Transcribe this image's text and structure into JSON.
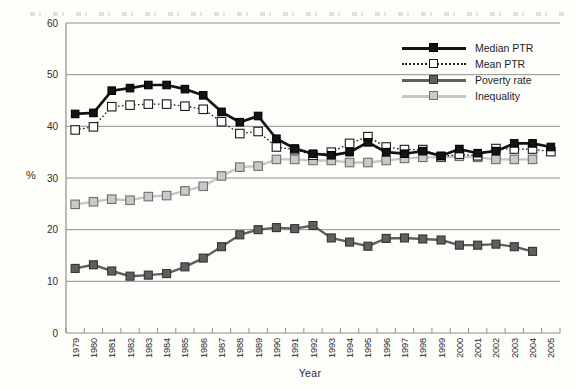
{
  "axis": {
    "y_unit_label": "%",
    "x_axis_label": "Year"
  },
  "style": {
    "background": "#fdfdfa",
    "grid_color": "#8f8f8f",
    "axis_color": "#8f8f8f",
    "tick_text_color": "#2e2e2e"
  },
  "chart_data": {
    "type": "line",
    "title": "",
    "xlabel": "Year",
    "ylabel": "%",
    "ylim": [
      0,
      60
    ],
    "yticks": [
      0,
      10,
      20,
      30,
      40,
      50,
      60
    ],
    "grid": "horizontal",
    "legend_position": "top-right",
    "x_tick_rotation": -90,
    "marker": "square",
    "categories": [
      "1979",
      "1980",
      "1981",
      "1982",
      "1983",
      "1984",
      "1985",
      "1986",
      "1987",
      "1988",
      "1989",
      "1990",
      "1991",
      "1992",
      "1993",
      "1994",
      "1995",
      "1996",
      "1997",
      "1998",
      "1999",
      "2000",
      "2001",
      "2002",
      "2003",
      "2004",
      "2005"
    ],
    "series": [
      {
        "name": "median_ptr",
        "label": "Median PTR",
        "line_style": "solid",
        "line_color": "#141414",
        "line_width": 2.7,
        "marker_fill": "#141414",
        "marker_stroke": "#000000",
        "marker_size": 7.5,
        "values": [
          42.4,
          42.6,
          46.9,
          47.4,
          48.0,
          48.0,
          47.2,
          46.0,
          42.8,
          40.8,
          42.0,
          37.6,
          35.7,
          34.7,
          34.4,
          35.0,
          36.9,
          35.0,
          34.7,
          35.2,
          34.3,
          35.6,
          34.8,
          35.2,
          36.7,
          36.7,
          36.0
        ]
      },
      {
        "name": "mean_ptr",
        "label": "Mean PTR",
        "line_style": "dotted",
        "line_color": "#1a1a1a",
        "line_width": 1.3,
        "marker_fill": "#ffffff",
        "marker_stroke": "#1a1a1a",
        "marker_size": 8.5,
        "values": [
          39.3,
          39.9,
          43.8,
          44.1,
          44.3,
          44.3,
          43.9,
          43.3,
          40.9,
          38.6,
          39.0,
          36.0,
          35.5,
          34.4,
          35.0,
          36.7,
          38.0,
          36.0,
          35.5,
          35.5,
          34.1,
          34.6,
          34.3,
          35.7,
          35.6,
          35.6,
          35.1
        ]
      },
      {
        "name": "poverty_rate",
        "label": "Poverty rate",
        "line_style": "solid",
        "line_color": "#5f5f5f",
        "line_width": 2.4,
        "marker_fill": "#5f5f5f",
        "marker_stroke": "#333333",
        "marker_size": 8,
        "values": [
          12.5,
          13.2,
          12.0,
          11.0,
          11.2,
          11.5,
          12.8,
          14.5,
          16.7,
          19.0,
          20.0,
          20.4,
          20.2,
          20.8,
          18.4,
          17.6,
          16.8,
          18.3,
          18.4,
          18.2,
          18.0,
          17.0,
          17.0,
          17.2,
          16.7,
          15.8,
          null
        ]
      },
      {
        "name": "inequality",
        "label": "Inequality",
        "line_style": "solid",
        "line_color": "#c6c6c6",
        "line_width": 2.4,
        "marker_fill": "#c9c9c9",
        "marker_stroke": "#6e6e6e",
        "marker_size": 8.5,
        "values": [
          24.9,
          25.4,
          25.9,
          25.7,
          26.4,
          26.6,
          27.5,
          28.4,
          30.4,
          32.1,
          32.3,
          33.6,
          33.6,
          33.4,
          33.4,
          33.0,
          33.0,
          33.4,
          33.8,
          34.0,
          34.0,
          34.2,
          34.0,
          33.6,
          33.6,
          33.6,
          null
        ]
      }
    ]
  }
}
